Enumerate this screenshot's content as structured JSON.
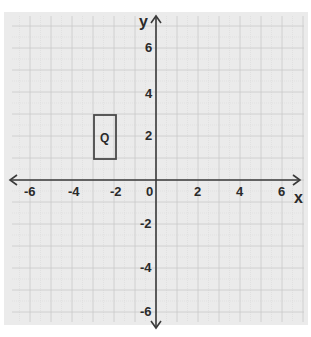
{
  "diagram": {
    "type": "coordinate-plane",
    "axes": {
      "x_label": "x",
      "y_label": "y",
      "x_ticks": [
        "-6",
        "-4",
        "-2",
        "0",
        "2",
        "4",
        "6"
      ],
      "y_ticks_positive": [
        "6",
        "4",
        "2"
      ],
      "y_ticks_negative": [
        "-2",
        "-4",
        "-6"
      ],
      "x_range": [
        -7,
        7
      ],
      "y_range": [
        -7,
        7
      ]
    },
    "shapes": [
      {
        "name": "Q",
        "kind": "rectangle",
        "label": "Q",
        "vertices": [
          [
            -3,
            1
          ],
          [
            -2,
            1
          ],
          [
            -2,
            3
          ],
          [
            -3,
            3
          ]
        ]
      }
    ],
    "colors": {
      "background": "#ebebeb",
      "grid": "#c9c9c9",
      "axis": "#3a3a3a",
      "shape_stroke": "#4a4a4a"
    }
  }
}
